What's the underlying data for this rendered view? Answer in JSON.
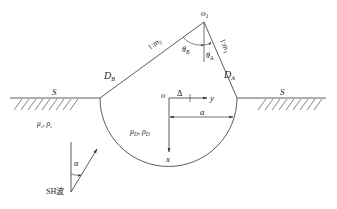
{
  "diagram": {
    "labels": {
      "apex": "o",
      "apex_sub": "1",
      "theta_b": "θ",
      "theta_b_sub": "B",
      "theta_a": "θ",
      "theta_a_sub": "A",
      "slope_b": "1:m",
      "slope_b_sub": "2",
      "slope_a": "1:m",
      "slope_a_sub": "1",
      "region_b": "D",
      "region_b_sub": "B",
      "region_a": "D",
      "region_a_sub": "A",
      "surface_left": "S",
      "surface_right": "S",
      "half_space_props": "μ",
      "half_space_props_sub1": "s",
      "half_space_props_mid": ", ρ",
      "half_space_props_sub2": "s",
      "valley_props": "μ",
      "valley_props_sub1": "D",
      "valley_props_mid": ", ρ",
      "valley_props_sub2": "D",
      "origin": "o",
      "delta": "Δ",
      "y_axis": "y",
      "x_axis": "x",
      "radius": "a",
      "incident_angle": "α",
      "wave_label": "SH波"
    },
    "colors": {
      "line": "#333333",
      "text": "#222222",
      "background": "#ffffff"
    }
  }
}
